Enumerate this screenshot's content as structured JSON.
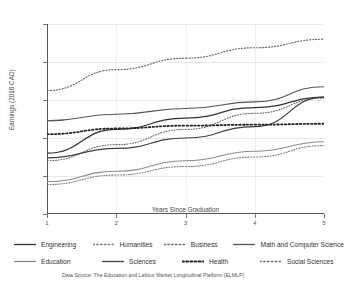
{
  "chart_data": {
    "type": "line",
    "title": "",
    "xlabel": "Years Since Graduation",
    "ylabel": "Earnings (2016 CAD)",
    "x": [
      1,
      2,
      3,
      4,
      5
    ],
    "xlim": [
      1,
      5
    ],
    "ylim": [
      30000,
      130000
    ],
    "xticks": [
      "1",
      "2",
      "3",
      "4",
      "5"
    ],
    "yticks": [
      "30,000",
      "50,000",
      "70,000",
      "90,000",
      "110,000",
      "130,000"
    ],
    "ytick_values": [
      30000,
      50000,
      70000,
      90000,
      110000,
      130000
    ],
    "grid": true,
    "legend_position": "below",
    "series": [
      {
        "name": "Engineering",
        "style": "solid",
        "color": "#333333",
        "width": 1.3,
        "values": [
          62000,
          74500,
          80500,
          86000,
          91500
        ]
      },
      {
        "name": "Humanities",
        "style": "dotted",
        "color": "#777777",
        "width": 1.1,
        "values": [
          45500,
          50500,
          55000,
          60000,
          66000
        ]
      },
      {
        "name": "Business",
        "style": "dotted",
        "color": "#666666",
        "width": 1.1,
        "values": [
          58000,
          66500,
          74500,
          83000,
          91000
        ]
      },
      {
        "name": "Math and Computer Science",
        "style": "solid",
        "color": "#555555",
        "width": 1.1,
        "values": [
          79000,
          82500,
          85500,
          89000,
          97000
        ]
      },
      {
        "name": "Education",
        "style": "solid",
        "color": "#8c8c8c",
        "width": 1.1,
        "values": [
          47000,
          52500,
          58000,
          63000,
          68000
        ]
      },
      {
        "name": "Sciences",
        "style": "solid",
        "color": "#3f3f3f",
        "width": 1.2,
        "values": [
          59500,
          64500,
          70000,
          76000,
          91500
        ]
      },
      {
        "name": "Health",
        "style": "dotted-thick",
        "color": "#222222",
        "width": 1.8,
        "values": [
          72000,
          75000,
          76500,
          77000,
          77500
        ]
      },
      {
        "name": "Social Sciences",
        "style": "dotted",
        "color": "#6a6a6a",
        "width": 1.2,
        "values": [
          95000,
          106000,
          112000,
          117500,
          122000
        ]
      }
    ]
  },
  "legend": {
    "rows": [
      [
        {
          "label": "Engineering",
          "style": "solid",
          "color": "#333333"
        },
        {
          "label": "Humanities",
          "style": "dotted",
          "color": "#777777"
        },
        {
          "label": "Business",
          "style": "dotted",
          "color": "#666666"
        },
        {
          "label": "Math and Computer Science",
          "style": "solid",
          "color": "#555555"
        }
      ],
      [
        {
          "label": "Education",
          "style": "solid",
          "color": "#8c8c8c"
        },
        {
          "label": "Sciences",
          "style": "solid",
          "color": "#3f3f3f"
        },
        {
          "label": "Health",
          "style": "dotted-thick",
          "color": "#222222"
        },
        {
          "label": "Social Sciences",
          "style": "dotted",
          "color": "#6a6a6a"
        }
      ]
    ]
  },
  "footnote": "Data Source: The Education and Labour Market Longitudinal Platform (ELMLP)"
}
